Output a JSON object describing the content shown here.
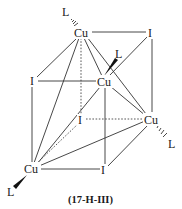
{
  "diagram": {
    "caption": "(17-H-III)",
    "atoms": {
      "cu_top": {
        "label": "Cu",
        "x": 81,
        "y": 37
      },
      "i_top_right": {
        "label": "I",
        "x": 151,
        "y": 37
      },
      "i_left": {
        "label": "I",
        "x": 33,
        "y": 85
      },
      "cu_center": {
        "label": "Cu",
        "x": 104,
        "y": 86
      },
      "i_back": {
        "label": "I",
        "x": 81,
        "y": 124
      },
      "cu_right": {
        "label": "Cu",
        "x": 150,
        "y": 124
      },
      "cu_bottom_left": {
        "label": "Cu",
        "x": 30,
        "y": 173
      },
      "i_bottom": {
        "label": "I",
        "x": 104,
        "y": 174
      }
    },
    "ligands": {
      "l_top": {
        "label": "L",
        "x": 66,
        "y": 16
      },
      "l_center": {
        "label": "L",
        "x": 119,
        "y": 58
      },
      "l_right": {
        "label": "L",
        "x": 172,
        "y": 148
      },
      "l_bottom": {
        "label": "L",
        "x": 11,
        "y": 196
      }
    },
    "colors": {
      "line": "#333333",
      "text": "#1a1a1a",
      "background": "#ffffff"
    }
  }
}
